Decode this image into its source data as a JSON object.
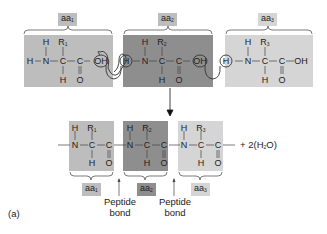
{
  "colors": {
    "aa1_fill": "#bdbdbd",
    "aa2_fill": "#8e8e8e",
    "aa3_fill": "#d5d5d5",
    "label_fill": "#b5b5b5",
    "line": "#333333"
  },
  "reactants": {
    "aa1": {
      "label": "aa",
      "sub": "1",
      "atoms": {
        "h_left": "H",
        "n": "N",
        "h_top": "H",
        "r": "R",
        "r_sub": "1",
        "c_alpha": "C",
        "h_bottom": "H",
        "c_carboxyl": "C",
        "o": "O",
        "oh": "OH"
      }
    },
    "aa2": {
      "label": "aa",
      "sub": "2",
      "atoms": {
        "h_left": "H",
        "n": "N",
        "h_top": "H",
        "r": "R",
        "r_sub": "2",
        "c_alpha": "C",
        "h_bottom": "H",
        "c_carboxyl": "C",
        "o": "O",
        "oh": "OH"
      }
    },
    "aa3": {
      "label": "aa",
      "sub": "3",
      "atoms": {
        "h_left": "H",
        "n": "N",
        "h_top": "H",
        "r": "R",
        "r_sub": "3",
        "c_alpha": "C",
        "h_bottom": "H",
        "c_carboxyl": "C",
        "o": "O",
        "oh": "OH"
      }
    }
  },
  "product": {
    "aa1": {
      "label": "aa",
      "sub": "1",
      "atoms": {
        "n": "N",
        "h_top": "H",
        "r": "R",
        "r_sub": "1",
        "c_alpha": "C",
        "h_bottom": "H",
        "c_carboxyl": "C",
        "o": "O"
      }
    },
    "aa2": {
      "label": "aa",
      "sub": "2",
      "atoms": {
        "n": "N",
        "h_top": "H",
        "r": "R",
        "r_sub": "2",
        "c_alpha": "C",
        "h_bottom": "H",
        "c_carboxyl": "C",
        "o": "O"
      }
    },
    "aa3": {
      "label": "aa",
      "sub": "3",
      "atoms": {
        "n": "N",
        "h_top": "H",
        "r": "R",
        "r_sub": "3",
        "c_alpha": "C",
        "h_bottom": "H",
        "c_carboxyl": "C",
        "o": "O"
      }
    },
    "water": {
      "prefix": "+ 2(H",
      "sub": "2",
      "suffix": "O)"
    },
    "bond_labels": [
      {
        "line1": "Peptide",
        "line2": "bond"
      },
      {
        "line1": "Peptide",
        "line2": "bond"
      }
    ]
  },
  "panel_label": "(a)"
}
